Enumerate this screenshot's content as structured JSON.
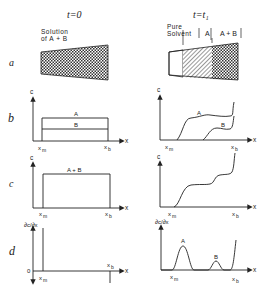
{
  "columns": {
    "left": {
      "title": "t=0"
    },
    "right": {
      "title": "t=t₁"
    }
  },
  "rows": {
    "a": {
      "label": "a"
    },
    "b": {
      "label": "b"
    },
    "c": {
      "label": "c"
    },
    "d": {
      "label": "d"
    }
  },
  "panel_a": {
    "left": {
      "label_line1": "Solution",
      "label_line2": "of  A + B"
    },
    "right": {
      "zone1_line1": "Pure",
      "zone1_line2": "Solvent",
      "zone2": "A",
      "zone3": "A + B"
    }
  },
  "axes": {
    "y_c": "c",
    "y_deriv": "∂c/∂x",
    "x": "x",
    "xm": "x",
    "xm_sub": "m",
    "xb": "x",
    "xb_sub": "b",
    "zero": "0"
  },
  "panel_b": {
    "left": {
      "curve_A": "A",
      "curve_B": "B"
    },
    "right": {
      "curve_A": "A",
      "curve_B": "B"
    }
  },
  "panel_c": {
    "left": {
      "curve": "A + B"
    }
  },
  "panel_d": {
    "right": {
      "peak_A": "A",
      "peak_B": "B"
    }
  },
  "colors": {
    "ink": "#222222",
    "background": "#ffffff"
  }
}
